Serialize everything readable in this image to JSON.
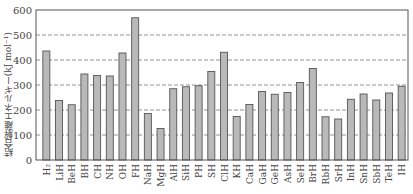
{
  "chart_data": {
    "type": "bar",
    "title": "",
    "xlabel": "",
    "ylabel": "結合解離エネルギー(kJ mol⁻¹)",
    "ylim": [
      0,
      600
    ],
    "yticks": [
      0,
      100,
      200,
      300,
      400,
      500,
      600
    ],
    "grid": "horizontal dashed",
    "legend": "none",
    "bar_color": "#b9b9b9",
    "categories": [
      "H2",
      "LiH",
      "BeH",
      "BH",
      "CH",
      "NH",
      "OH",
      "FH",
      "NaH",
      "MgH",
      "AlH",
      "SiH",
      "PH",
      "SH",
      "ClH",
      "KH",
      "CaH",
      "GaH",
      "GeH",
      "AsH",
      "SeH",
      "BrH",
      "RbH",
      "SrH",
      "InH",
      "SnH",
      "SbH",
      "TeH",
      "IH"
    ],
    "category_labels": [
      "H₂",
      "LiH",
      "BeH",
      "BH",
      "CH",
      "NH",
      "OH",
      "FH",
      "NaH",
      "MgH",
      "AlH",
      "SiH",
      "PH",
      "SH",
      "ClH",
      "KH",
      "CaH",
      "GaH",
      "GeH",
      "AsH",
      "SeH",
      "BrH",
      "RbH",
      "SrH",
      "InH",
      "SnH",
      "SbH",
      "TeH",
      "IH"
    ],
    "values": [
      436,
      238,
      221,
      344,
      338,
      336,
      428,
      569,
      186,
      126,
      285,
      293,
      297,
      354,
      431,
      174,
      222,
      274,
      263,
      270,
      310,
      366,
      173,
      164,
      243,
      264,
      240,
      268,
      295
    ]
  }
}
